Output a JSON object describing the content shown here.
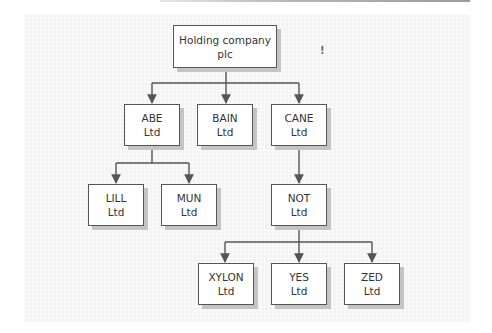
{
  "diagram": {
    "type": "organisation-chart",
    "mark": "!",
    "colors": {
      "box_border": "#555555",
      "box_fill": "#ffffff",
      "box_shadow": "#c4c4c4",
      "connector": "#555555",
      "panel_background": "#f3f3f3",
      "text": "#333333"
    },
    "nodes": {
      "holding": {
        "line1": "Holding company",
        "line2": "plc"
      },
      "abe": {
        "line1": "ABE",
        "line2": "Ltd"
      },
      "bain": {
        "line1": "BAIN",
        "line2": "Ltd"
      },
      "cane": {
        "line1": "CANE",
        "line2": "Ltd"
      },
      "lill": {
        "line1": "LILL",
        "line2": "Ltd"
      },
      "mun": {
        "line1": "MUN",
        "line2": "Ltd"
      },
      "not": {
        "line1": "NOT",
        "line2": "Ltd"
      },
      "xylon": {
        "line1": "XYLON",
        "line2": "Ltd"
      },
      "yes": {
        "line1": "YES",
        "line2": "Ltd"
      },
      "zed": {
        "line1": "ZED",
        "line2": "Ltd"
      }
    },
    "edges": [
      [
        "holding",
        "abe"
      ],
      [
        "holding",
        "bain"
      ],
      [
        "holding",
        "cane"
      ],
      [
        "abe",
        "lill"
      ],
      [
        "abe",
        "mun"
      ],
      [
        "cane",
        "not"
      ],
      [
        "not",
        "xylon"
      ],
      [
        "not",
        "yes"
      ],
      [
        "not",
        "zed"
      ]
    ]
  }
}
